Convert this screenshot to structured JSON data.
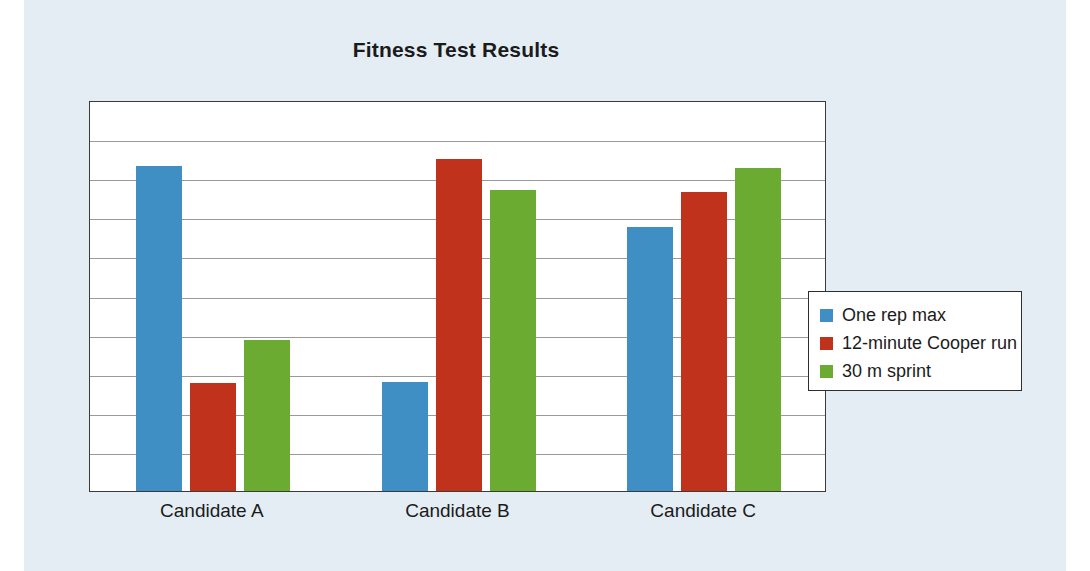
{
  "chart_data": {
    "type": "bar",
    "title": "Fitness Test Results",
    "xlabel": "",
    "ylabel": "",
    "categories": [
      "Candidate A",
      "Candidate B",
      "Candidate C"
    ],
    "series": [
      {
        "name": "One rep max",
        "color": "#3f8fc4",
        "values": [
          8.3,
          2.8,
          6.75
        ]
      },
      {
        "name": "12-minute Cooper run",
        "color": "#c0321b",
        "values": [
          2.75,
          8.5,
          7.65
        ]
      },
      {
        "name": "30 m sprint",
        "color": "#6cab32",
        "values": [
          3.85,
          7.7,
          8.25
        ]
      }
    ],
    "ylim": [
      0,
      10
    ],
    "yticks": [
      0,
      1,
      2,
      3,
      4,
      5,
      6,
      7,
      8,
      9,
      10
    ],
    "ytick_labels": [],
    "grid": true,
    "legend_position": "right",
    "legend_entries": [
      "One rep max",
      "12-minute Cooper run",
      "30 m sprint"
    ]
  },
  "colors": {
    "background_panel": "#e4edf4",
    "page_background": "#ffffff",
    "plot_background": "#ffffff",
    "axis": "#3a3a3a",
    "gridline": "#9a9a9a",
    "text": "#1b1b1b"
  }
}
